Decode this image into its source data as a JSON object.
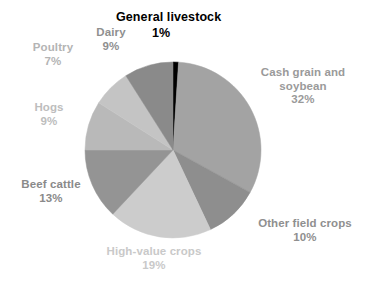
{
  "chart_data": {
    "type": "pie",
    "title": "General livestock",
    "subtitle": "",
    "xlabel": "",
    "ylabel": "",
    "legend_position": "none",
    "grid": false,
    "unit": "%",
    "start_angle_deg": 0,
    "direction": "clockwise",
    "categories": [
      "General livestock",
      "Cash grain and soybean",
      "Other field crops",
      "High-value crops",
      "Beef cattle",
      "Hogs",
      "Poultry",
      "Dairy"
    ],
    "values": [
      1,
      32,
      10,
      19,
      13,
      9,
      7,
      9
    ],
    "slices": [
      {
        "name": "General livestock",
        "label_line1": "General livestock",
        "label_line2": "",
        "value": 1,
        "value_label": "1%",
        "color": "#000000",
        "label_color": "#000000",
        "bold_label": true
      },
      {
        "name": "Cash grain and soybean",
        "label_line1": "Cash grain and",
        "label_line2": "soybean",
        "value": 32,
        "value_label": "32%",
        "color": "#a3a3a3",
        "label_color": "#9a9a9a",
        "bold_label": true
      },
      {
        "name": "Other field crops",
        "label_line1": "Other field crops",
        "label_line2": "",
        "value": 10,
        "value_label": "10%",
        "color": "#8e8e8e",
        "label_color": "#8f8f8f",
        "bold_label": true
      },
      {
        "name": "High-value crops",
        "label_line1": "High-value crops",
        "label_line2": "",
        "value": 19,
        "value_label": "19%",
        "color": "#cccccc",
        "label_color": "#c9c9c9",
        "bold_label": true
      },
      {
        "name": "Beef cattle",
        "label_line1": "Beef cattle",
        "label_line2": "",
        "value": 13,
        "value_label": "13%",
        "color": "#949494",
        "label_color": "#8a8a8a",
        "bold_label": true
      },
      {
        "name": "Hogs",
        "label_line1": "Hogs",
        "label_line2": "",
        "value": 9,
        "value_label": "9%",
        "color": "#b9b9b9",
        "label_color": "#bdbdbd",
        "bold_label": true
      },
      {
        "name": "Poultry",
        "label_line1": "Poultry",
        "label_line2": "",
        "value": 7,
        "value_label": "7%",
        "color": "#c4c4c4",
        "label_color": "#b4b4b4",
        "bold_label": true
      },
      {
        "name": "Dairy",
        "label_line1": "Dairy",
        "label_line2": "",
        "value": 9,
        "value_label": "9%",
        "color": "#8a8a8a",
        "label_color": "#8f8f8f",
        "bold_label": true
      }
    ],
    "geometry": {
      "center_x": 173,
      "center_y": 150,
      "radius": 88
    },
    "background_color": "#ffffff"
  }
}
